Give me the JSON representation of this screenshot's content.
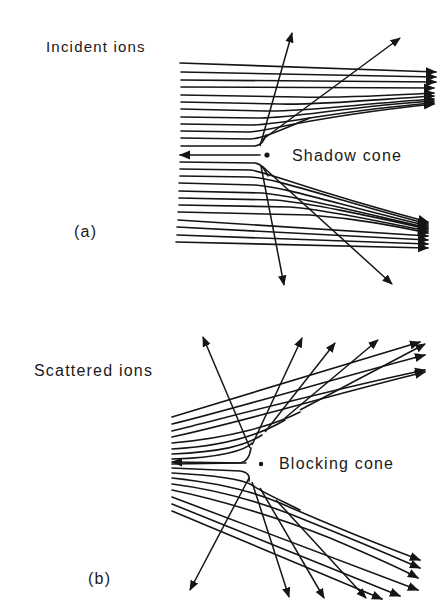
{
  "figure": {
    "panel_a": {
      "tag": "(a)",
      "incident_label": "Incident ions",
      "cone_label": "Shadow cone"
    },
    "panel_b": {
      "tag": "(b)",
      "scattered_label": "Scattered ions",
      "cone_label": "Blocking cone"
    },
    "colors": {
      "ink": "#151515",
      "background": "#ffffff"
    }
  }
}
